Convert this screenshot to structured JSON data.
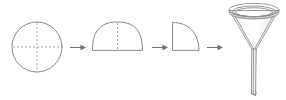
{
  "figure": {
    "title": "Folding a filter paper and placing it in a funnel",
    "width": 286,
    "height": 100,
    "background_color": "#ffffff",
    "line_color": "#8a8a8a",
    "fold_line_color": "#9a9a9a",
    "arrow_color": "#6f6f6f",
    "glass_tint_color": "#f2f2f2"
  },
  "steps": [
    {
      "index": 1,
      "name": "circle",
      "label": "Circular filter paper",
      "description": "Flat round filter paper with dashed horizontal and vertical fold lines",
      "geometry": {
        "center_x": 37,
        "center_y": 47,
        "radius": 25
      },
      "fold_lines": [
        "horizontal-diameter",
        "vertical-diameter"
      ]
    },
    {
      "index": 2,
      "name": "semicircle",
      "label": "Folded in half",
      "description": "Semicircular dome with a dashed vertical fold line at the centre",
      "geometry": {
        "left_x": 92,
        "right_x": 143,
        "baseline_y": 50,
        "apex_y": 22
      },
      "fold_lines": [
        "vertical-centre"
      ]
    },
    {
      "index": 3,
      "name": "quarter-circle",
      "label": "Folded in quarters",
      "description": "Quarter circle with straight left and bottom edges and a curved arc",
      "geometry": {
        "corner_x": 172,
        "corner_y": 50,
        "top_y": 22,
        "right_x": 199
      },
      "fold_lines": []
    },
    {
      "index": 4,
      "name": "funnel",
      "label": "Opened cone placed in funnel",
      "description": "Glass funnel with an elliptical rim, conical body and long narrow stem",
      "geometry": {
        "rim_center_x": 254,
        "rim_center_y": 10,
        "rim_radius_x": 25,
        "rim_radius_y": 6.5,
        "cone_bottom_y": 49,
        "stem_bottom_y": 95,
        "stem_width": 5
      },
      "fold_lines": []
    }
  ],
  "arrows": [
    {
      "name": "arrow-1",
      "from_step": 1,
      "to_step": 2,
      "x1": 70,
      "x2": 85,
      "y": 47
    },
    {
      "name": "arrow-2",
      "from_step": 2,
      "to_step": 3,
      "x1": 152,
      "x2": 168,
      "y": 47
    },
    {
      "name": "arrow-3",
      "from_step": 3,
      "to_step": 4,
      "x1": 207,
      "x2": 222,
      "y": 47
    }
  ]
}
